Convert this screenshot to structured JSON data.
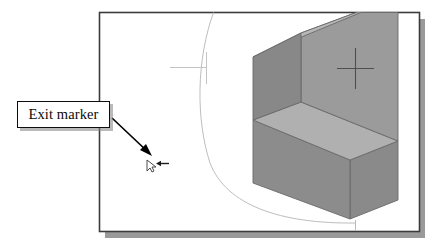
{
  "figure": {
    "type": "cad-screenshot-annotation",
    "title": "",
    "background_color": "#ffffff"
  },
  "callout": {
    "label": "Exit marker",
    "box_border_color": "#0d0d0d",
    "box_fill_color": "#ffffff",
    "shadow_color": "#828282",
    "leader_color": "#000000"
  },
  "cad_window": {
    "name": "drawing-frame",
    "border_color": "#3c3c3c",
    "fill_color": "#ffffff",
    "shadow_color": "#9a9a9a"
  },
  "geometry": {
    "arc": {
      "name": "construction-arc",
      "color": "#b9b9b9"
    },
    "centerline": {
      "name": "center-mark",
      "color": "#c2c2c2"
    },
    "crosshair_marker": {
      "name": "crosshair-marker",
      "color": "#5a5a5a"
    },
    "solid_model": {
      "name": "l-shaped-solid",
      "top_face_color": "#b5b5b5",
      "front_face_color": "#8c8c8c",
      "side_face_color": "#7e7e7e",
      "inner_face_color": "#9b9b9b",
      "base_top_color": "#b0b0b0",
      "edge_color": "#6a6a6a"
    }
  },
  "cursor": {
    "name": "exit-marker-cursor",
    "glyph_color": "#4a4a4a",
    "arrow_color": "#1a1a1a"
  }
}
